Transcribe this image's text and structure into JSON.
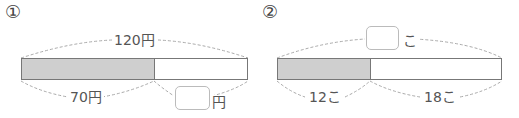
{
  "problems": [
    {
      "number": "①",
      "total_label": "120円",
      "part_a_label": "70円",
      "answer_unit": "円",
      "answer_value": ""
    },
    {
      "number": "②",
      "total_unit": "こ",
      "total_value": "",
      "part_a_label": "12こ",
      "part_b_label": "18こ"
    }
  ],
  "colors": {
    "shaded": "#cfcfcf",
    "line": "#777777",
    "dash": "#aaaaaa"
  }
}
